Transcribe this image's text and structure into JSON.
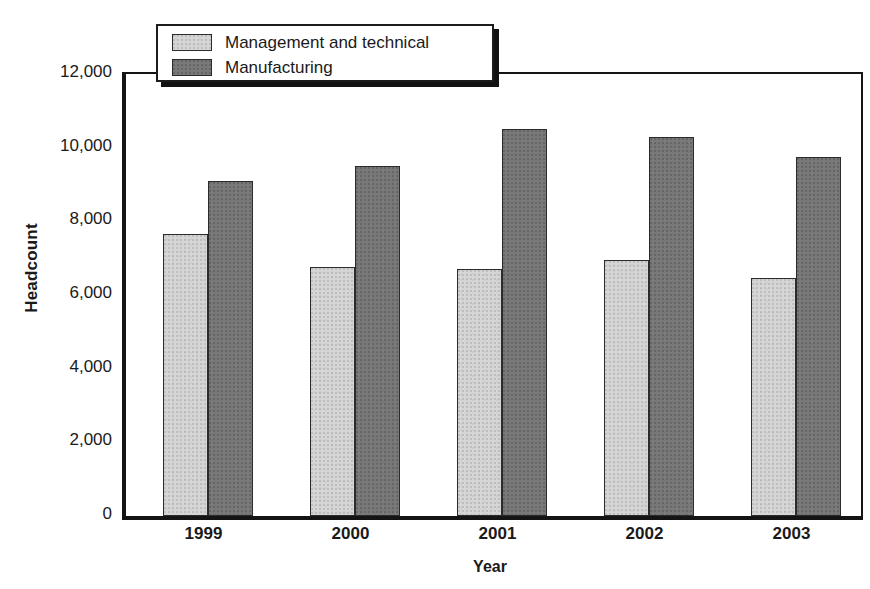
{
  "chart_data": {
    "type": "bar",
    "title": "",
    "subtitle": "",
    "xlabel": "Year",
    "ylabel": "Headcount",
    "categories": [
      "1999",
      "2000",
      "2001",
      "2002",
      "2003"
    ],
    "series": [
      {
        "name": "Management and technical",
        "color": "#d6d6d6",
        "values": [
          7650,
          6750,
          6700,
          6950,
          6450
        ]
      },
      {
        "name": "Manufacturing",
        "color": "#787878",
        "values": [
          9100,
          9500,
          10500,
          10300,
          9750
        ]
      }
    ],
    "ylim": [
      0,
      12000
    ],
    "ytick_values": [
      0,
      2000,
      4000,
      6000,
      8000,
      10000,
      12000
    ],
    "ytick_labels": [
      "0",
      "2,000",
      "4,000",
      "6,000",
      "8,000",
      "10,000",
      "12,000"
    ],
    "grid": false,
    "legend_position": "top-left-inside",
    "annotations": []
  },
  "legend": {
    "items": [
      {
        "label": "Management and technical",
        "swatch": "light-gray-swatch"
      },
      {
        "label": "Manufacturing",
        "swatch": "dark-gray-swatch"
      }
    ]
  }
}
